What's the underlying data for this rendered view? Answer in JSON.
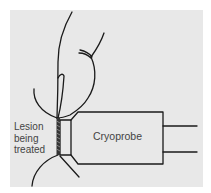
{
  "diagram": {
    "labels": {
      "lesion_line1": "Lesion",
      "lesion_line2": "being",
      "lesion_line3": "treated",
      "probe": "Cryoprobe"
    },
    "colors": {
      "background": "#e8e8e8",
      "line": "#1a1a1a",
      "text": "#444444"
    }
  }
}
